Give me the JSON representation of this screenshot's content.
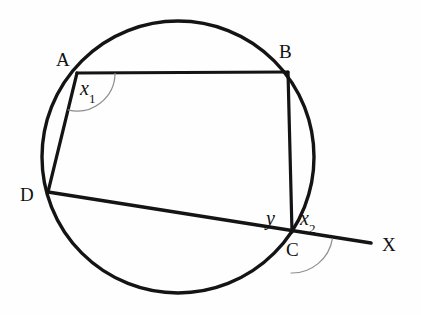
{
  "figure": {
    "background_color": "#fefefe",
    "stroke_color": "#141414",
    "arc_color": "#8d8d8d",
    "width": 421,
    "height": 315
  },
  "circle": {
    "name": "circumscribed-circle",
    "cx": 178,
    "cy": 157,
    "r": 136,
    "stroke_width": 3.4
  },
  "points": {
    "A": {
      "label": "A",
      "x": 77,
      "y": 73,
      "label_x": 56,
      "label_y": 50
    },
    "B": {
      "label": "B",
      "x": 288,
      "y": 72,
      "label_x": 279,
      "label_y": 42
    },
    "C": {
      "label": "C",
      "x": 292,
      "y": 232,
      "label_x": 286,
      "label_y": 240
    },
    "D": {
      "label": "D",
      "x": 48,
      "y": 192,
      "label_x": 20,
      "label_y": 185
    },
    "X": {
      "label": "X",
      "x": 371,
      "y": 243,
      "label_x": 382,
      "label_y": 235
    }
  },
  "segments": [
    {
      "name": "chord-AB",
      "from": "A",
      "to": "B",
      "x1": 77,
      "y1": 73,
      "x2": 288,
      "y2": 72,
      "width": 3.2
    },
    {
      "name": "chord-BC",
      "from": "B",
      "to": "C",
      "x1": 288,
      "y1": 72,
      "x2": 292,
      "y2": 232,
      "width": 3.2
    },
    {
      "name": "chord-AD",
      "from": "A",
      "to": "D",
      "x1": 77,
      "y1": 73,
      "x2": 48,
      "y2": 192,
      "width": 3.2
    },
    {
      "name": "secant-DCX",
      "from": "D",
      "to": "X",
      "x1": 48,
      "y1": 192,
      "x2": 371,
      "y2": 243,
      "width": 3.6
    }
  ],
  "angle_arcs": [
    {
      "name": "angle-arc-x1",
      "at": "A",
      "cx": 77,
      "cy": 73,
      "r": 38,
      "start_deg": 0,
      "end_deg": 104,
      "stroke_width": 1.2
    },
    {
      "name": "angle-arc-x2",
      "at": "C",
      "cx": 292,
      "cy": 232,
      "r": 41,
      "start_deg": 9,
      "end_deg": 92,
      "stroke_width": 1.2
    }
  ],
  "angle_labels": [
    {
      "name": "angle-label-x1",
      "base": "x",
      "subscript": "1",
      "x": 80,
      "y": 78
    },
    {
      "name": "angle-label-x2",
      "base": "x",
      "subscript": "2",
      "x": 300,
      "y": 208
    },
    {
      "name": "angle-label-y",
      "base": "y",
      "subscript": "",
      "x": 266,
      "y": 208
    }
  ]
}
